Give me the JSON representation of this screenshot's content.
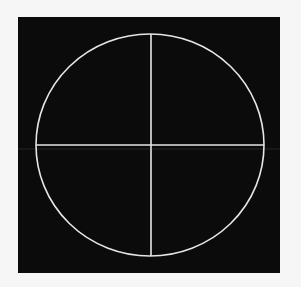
{
  "figure": {
    "background_color": "#f6f6f6",
    "panel": {
      "color": "#0b0b0b",
      "x": 18,
      "y": 17,
      "width": 262,
      "height": 256
    },
    "circle": {
      "cx": 150,
      "cy": 145,
      "rx": 114,
      "ry": 111,
      "stroke": "#e6e6e6",
      "stroke_width": 1.6
    },
    "crosshair": {
      "vertical": {
        "x": 151,
        "y1": 34,
        "y2": 256
      },
      "horizontal": {
        "y": 145,
        "x1": 36,
        "x2": 264
      },
      "stroke": "#e6e6e6",
      "stroke_width": 1.6
    },
    "artifact_line": {
      "y": 149,
      "x1": 18,
      "x2": 280,
      "stroke": "#3a3a3a"
    }
  }
}
